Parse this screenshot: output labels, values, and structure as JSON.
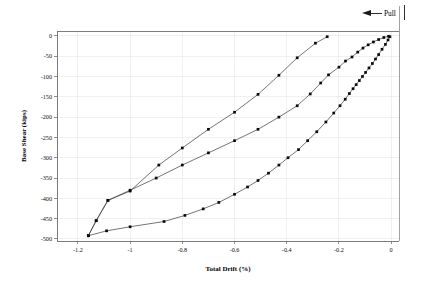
{
  "chart_data": {
    "type": "line",
    "title": "",
    "xlabel": "Total Drift (%)",
    "ylabel": "Base Shear (kips)",
    "xlim": [
      -1.28,
      0.03
    ],
    "ylim": [
      -505,
      12
    ],
    "xticks": [
      "-1.2",
      "-1",
      "-0.8",
      "-0.6",
      "-0.4",
      "-0.2",
      "0"
    ],
    "xtick_values": [
      -1.2,
      -1.0,
      -0.8,
      -0.6,
      -0.4,
      -0.2,
      0
    ],
    "yticks": [
      "0",
      "-50",
      "-100",
      "-150",
      "-200",
      "-250",
      "-300",
      "-350",
      "-400",
      "-450",
      "-500"
    ],
    "ytick_values": [
      0,
      -50,
      -100,
      -150,
      -200,
      -250,
      -300,
      -350,
      -400,
      -450,
      -500
    ],
    "grid": true,
    "legend": "none",
    "annotations": [
      {
        "name": "pull-direction",
        "label": "Pull",
        "arrow": "left",
        "x": -0.12,
        "y": 40
      }
    ],
    "series": [
      {
        "name": "loading-branch",
        "marker": "square",
        "points": [
          [
            -0.005,
            -2
          ],
          [
            -0.012,
            -10
          ],
          [
            -0.022,
            -21
          ],
          [
            -0.035,
            -33
          ],
          [
            -0.048,
            -46
          ],
          [
            -0.06,
            -57
          ],
          [
            -0.072,
            -68
          ],
          [
            -0.085,
            -79
          ],
          [
            -0.098,
            -90
          ],
          [
            -0.11,
            -100
          ],
          [
            -0.122,
            -110
          ],
          [
            -0.134,
            -120
          ],
          [
            -0.146,
            -130
          ],
          [
            -0.16,
            -142
          ],
          [
            -0.176,
            -156
          ],
          [
            -0.196,
            -172
          ],
          [
            -0.22,
            -190
          ],
          [
            -0.25,
            -212
          ],
          [
            -0.285,
            -236
          ],
          [
            -0.32,
            -258
          ],
          [
            -0.355,
            -280
          ],
          [
            -0.395,
            -300
          ],
          [
            -0.43,
            -318
          ],
          [
            -0.47,
            -338
          ],
          [
            -0.51,
            -356
          ],
          [
            -0.55,
            -372
          ],
          [
            -0.6,
            -390
          ],
          [
            -0.66,
            -410
          ],
          [
            -0.72,
            -426
          ],
          [
            -0.79,
            -442
          ],
          [
            -0.87,
            -457
          ],
          [
            -1.0,
            -470
          ],
          [
            -1.09,
            -480
          ],
          [
            -1.16,
            -492
          ]
        ]
      },
      {
        "name": "unloading-branch",
        "marker": "square",
        "points": [
          [
            -1.16,
            -492
          ],
          [
            -1.13,
            -455
          ],
          [
            -1.085,
            -405
          ],
          [
            -1.0,
            -380
          ],
          [
            -0.9,
            -350
          ],
          [
            -0.8,
            -318
          ],
          [
            -0.7,
            -288
          ],
          [
            -0.6,
            -258
          ],
          [
            -0.51,
            -230
          ],
          [
            -0.43,
            -200
          ],
          [
            -0.36,
            -172
          ],
          [
            -0.31,
            -143
          ],
          [
            -0.27,
            -116
          ],
          [
            -0.24,
            -96
          ],
          [
            -0.2,
            -77
          ],
          [
            -0.175,
            -62
          ],
          [
            -0.15,
            -52
          ],
          [
            -0.128,
            -40
          ],
          [
            -0.108,
            -30
          ],
          [
            -0.088,
            -22
          ],
          [
            -0.068,
            -15
          ],
          [
            -0.048,
            -9
          ],
          [
            -0.028,
            -4
          ],
          [
            -0.01,
            -1
          ]
        ]
      },
      {
        "name": "upper-unload-branch",
        "marker": "square",
        "points": [
          [
            -1.16,
            -492
          ],
          [
            -1.13,
            -455
          ],
          [
            -1.085,
            -405
          ],
          [
            -1.0,
            -382
          ],
          [
            -0.89,
            -318
          ],
          [
            -0.8,
            -276
          ],
          [
            -0.7,
            -230
          ],
          [
            -0.6,
            -188
          ],
          [
            -0.51,
            -144
          ],
          [
            -0.43,
            -97
          ],
          [
            -0.36,
            -54
          ],
          [
            -0.29,
            -18
          ],
          [
            -0.245,
            -2
          ]
        ]
      }
    ]
  }
}
